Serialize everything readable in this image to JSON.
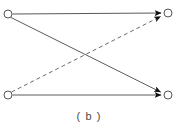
{
  "figure": {
    "caption": "( b )",
    "background_color": "#ffffff",
    "stroke_color": "#555555",
    "node_fill_color": "#ffffff",
    "arrow_color": "#1a1a1a",
    "width": 178,
    "height": 130
  },
  "diagram": {
    "type": "directed-graph",
    "node_radius": 4,
    "nodes": [
      {
        "id": "top-left",
        "label": "",
        "x": 8,
        "y": 14
      },
      {
        "id": "top-right",
        "label": "",
        "x": 168,
        "y": 13
      },
      {
        "id": "bottom-left",
        "label": "",
        "x": 8,
        "y": 95
      },
      {
        "id": "bottom-right",
        "label": "",
        "x": 168,
        "y": 95
      }
    ],
    "edges": [
      {
        "id": "edge-tl-tr",
        "from": "top-left",
        "to": "top-right",
        "style": "solid",
        "arrow": true
      },
      {
        "id": "edge-tl-br",
        "from": "top-left",
        "to": "bottom-right",
        "style": "solid",
        "arrow": true
      },
      {
        "id": "edge-bl-br",
        "from": "bottom-left",
        "to": "bottom-right",
        "style": "solid",
        "arrow": true
      },
      {
        "id": "edge-bl-tr",
        "from": "bottom-left",
        "to": "top-right",
        "style": "dashed",
        "arrow": true
      }
    ],
    "dash_pattern": "4 3"
  }
}
